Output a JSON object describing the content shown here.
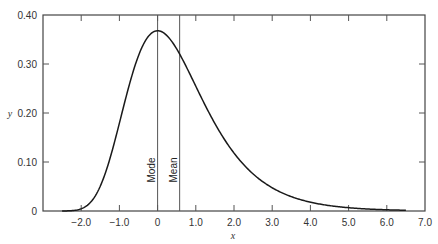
{
  "chart_data": {
    "type": "line",
    "title": "",
    "xlabel": "x",
    "ylabel": "y",
    "xlim": [
      -3.0,
      7.0
    ],
    "ylim": [
      0,
      0.4
    ],
    "grid": false,
    "x_ticks": [
      -2.0,
      -1.0,
      0,
      1.0,
      2.0,
      3.0,
      4.0,
      5.0,
      6.0,
      7.0
    ],
    "x_tick_labels": [
      "−2.0",
      "−1.0",
      "0",
      "1.0",
      "2.0",
      "3.0",
      "4.0",
      "5.0",
      "6.0",
      "7.0"
    ],
    "y_ticks": [
      0,
      0.1,
      0.2,
      0.3,
      0.4
    ],
    "y_tick_labels": [
      "0",
      "0.10",
      "0.20",
      "0.30",
      "0.40"
    ],
    "series": [
      {
        "name": "density",
        "x": [
          -2.5,
          -2.25,
          -2.0,
          -1.75,
          -1.5,
          -1.25,
          -1.0,
          -0.75,
          -0.5,
          -0.25,
          0.0,
          0.25,
          0.5,
          0.75,
          1.0,
          1.25,
          1.5,
          1.75,
          2.0,
          2.5,
          3.0,
          3.5,
          4.0,
          4.5,
          5.0,
          5.5,
          6.0,
          6.5
        ],
        "values": [
          0.0,
          0.0,
          0.005,
          0.02,
          0.051,
          0.095,
          0.179,
          0.256,
          0.32,
          0.358,
          0.368,
          0.351,
          0.315,
          0.273,
          0.231,
          0.191,
          0.156,
          0.126,
          0.118,
          0.075,
          0.047,
          0.029,
          0.018,
          0.011,
          0.007,
          0.004,
          0.002,
          0.002
        ]
      }
    ],
    "annotations": [
      {
        "label": "Mode",
        "x": 0.0
      },
      {
        "label": "Mean",
        "x": 0.577
      }
    ]
  }
}
